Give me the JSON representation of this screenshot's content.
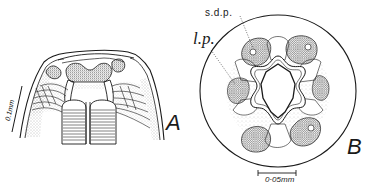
{
  "figure": {
    "panels": [
      {
        "id": "A",
        "label": "A",
        "description": "Lateral view of nematode head, longitudinal section",
        "scale_bar": {
          "text": "0.1mm",
          "orientation": "diagonal-left"
        }
      },
      {
        "id": "B",
        "label": "B",
        "description": "En face view of nematode head",
        "annotations": [
          {
            "text": "s.d.p.",
            "target": "subdorsal papilla"
          },
          {
            "text": "l.p.",
            "target": "lateral papilla"
          }
        ],
        "scale_bar": {
          "text": "0·05mm",
          "orientation": "horizontal-bottom"
        }
      }
    ]
  },
  "colors": {
    "ink": "#1a1a1a",
    "stipple": "#555555",
    "paper": "#ffffff"
  }
}
